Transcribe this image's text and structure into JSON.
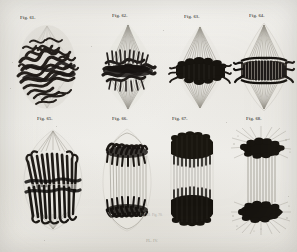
{
  "plate": {
    "background_color": "#f2f1ee",
    "ink_color": "#2b2823",
    "fiber_color": "#9a968c",
    "label_color": "#3b3832",
    "figure_count": 8,
    "rows": 2,
    "columns": 4,
    "bottom_caption": "PL. IV.",
    "stray_mark_left": "Fig. 69.",
    "stray_mark_right": "Fig. 70."
  },
  "figures": [
    {
      "id": "fig-61",
      "label": "Fig. 61.",
      "stage": "early-metaphase-tangled-chromosomes",
      "row": 1,
      "column": 1,
      "description": "Dense tangled thick chromosome threads forming irregular equatorial mass with faint spindle halo"
    },
    {
      "id": "fig-62",
      "label": "Fig. 62.",
      "stage": "metaphase-plate-forming",
      "row": 1,
      "column": 2,
      "description": "Compact dark chromosome band with radiating achromatic spindle fibers above and below"
    },
    {
      "id": "fig-63",
      "label": "Fig. 63.",
      "stage": "metaphase-equatorial-plate",
      "row": 1,
      "column": 3,
      "description": "Solid black equatorial plate with spindle fibers converging to poles"
    },
    {
      "id": "fig-64",
      "label": "Fig. 64.",
      "stage": "metaphase-spindle-diamond",
      "row": 1,
      "column": 4,
      "description": "Striated chromosome plate in a clear diamond-shaped achromatic spindle"
    },
    {
      "id": "fig-65",
      "label": "Fig. 65.",
      "stage": "early-anaphase-splitting",
      "row": 2,
      "column": 1,
      "description": "Barrel-shaped spindle with chromosome halves beginning to separate into two groups"
    },
    {
      "id": "fig-66",
      "label": "Fig. 66.",
      "stage": "anaphase-daughter-groups",
      "row": 2,
      "column": 2,
      "description": "Two daughter chromosome groups drawn toward poles with long connecting fibers"
    },
    {
      "id": "fig-67",
      "label": "Fig. 67.",
      "stage": "late-anaphase-barrel",
      "row": 2,
      "column": 3,
      "description": "Cylindrical barrel spindle with dense chromosome masses at both ends"
    },
    {
      "id": "fig-68",
      "label": "Fig. 68.",
      "stage": "telophase-with-asters",
      "row": 2,
      "column": 4,
      "description": "Widely separated chromosome masses with central spindle fibers and radiating astral rays"
    }
  ]
}
